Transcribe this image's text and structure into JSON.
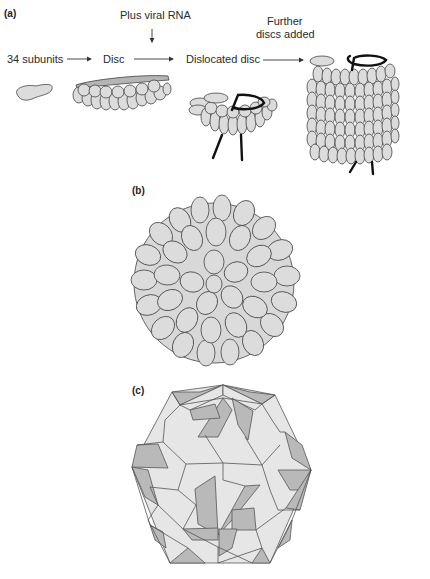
{
  "figure": {
    "panels": [
      {
        "id": "a",
        "label": "(a)",
        "steps": [
          {
            "text": "34 subunits"
          },
          {
            "text": "Disc"
          },
          {
            "text": "Dislocated disc"
          }
        ],
        "annotations": {
          "plus_rna": "Plus viral RNA",
          "further_line1": "Further",
          "further_line2": "discs added"
        }
      },
      {
        "id": "b",
        "label": "(b)"
      },
      {
        "id": "c",
        "label": "(c)"
      }
    ],
    "colors": {
      "subunit_fill": "#dcdcdc",
      "subunit_stroke": "#444444",
      "rna": "#111111",
      "face_light": "#e6e6e6",
      "face_dark": "#b9b9b9"
    }
  }
}
